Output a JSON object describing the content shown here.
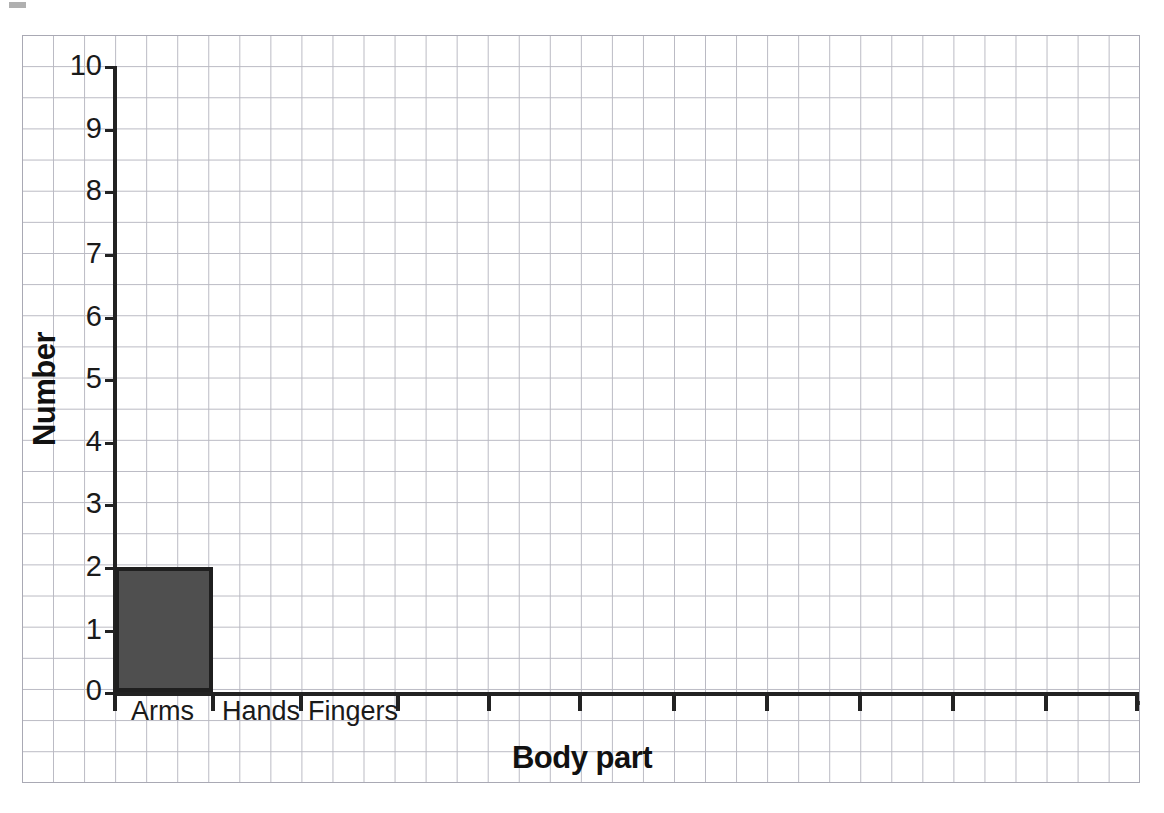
{
  "chart_data": {
    "type": "bar",
    "title": "",
    "xlabel": "Body part",
    "ylabel": "Number",
    "categories": [
      "Arms",
      "Hands",
      "Fingers"
    ],
    "values": [
      2,
      0,
      0
    ],
    "series": [
      {
        "name": "Number",
        "values": [
          2,
          0,
          0
        ]
      }
    ],
    "ylim": [
      0,
      10
    ],
    "y_ticks": [
      0,
      1,
      2,
      3,
      4,
      5,
      6,
      7,
      8,
      9,
      10
    ],
    "y_tick_labels": [
      "0",
      "1",
      "2",
      "3",
      "4",
      "5",
      "6",
      "7",
      "8",
      "9",
      "10"
    ],
    "grid": true,
    "grid_style": "graph-paper",
    "legend": false,
    "bar_color": "#4f4f4f",
    "bar_edge_color": "#1f1f1f",
    "axis_color": "#222222",
    "grid_color": "#b9b9c2",
    "background_color": "#ffffff",
    "annotations": [],
    "x_tick_count": 12
  },
  "axes": {
    "y_title": "Number",
    "x_title": "Body part"
  },
  "ticks": {
    "y": [
      "10",
      "9",
      "8",
      "7",
      "6",
      "5",
      "4",
      "3",
      "2",
      "1",
      "0"
    ]
  },
  "categories": {
    "labels": [
      "Arms",
      "Hands",
      "Fingers"
    ]
  }
}
